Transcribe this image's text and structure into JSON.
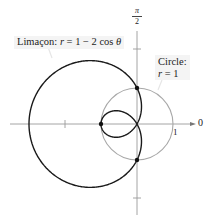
{
  "diagram": {
    "type": "polar-graph",
    "origin_px": [
      137,
      124
    ],
    "unit_px": 36,
    "axes": {
      "polar_axis_label": "0",
      "vertical_axis_label_num": "π",
      "vertical_axis_label_den": "2",
      "tick_label_1": "1"
    },
    "curves": [
      {
        "name": "limacon",
        "label_prefix": "Limaçon: ",
        "label_var": "r",
        "label_eq": " = 1 − 2 cos ",
        "label_theta": "θ",
        "color": "#1a1a1a"
      },
      {
        "name": "circle",
        "label_line1": "Circle:",
        "label_var": "r",
        "label_eq": " = 1",
        "color": "#9a9a9a"
      }
    ],
    "intersection_points": [
      {
        "polar": "r=1, θ=π/2",
        "px": [
          137,
          88
        ]
      },
      {
        "polar": "r=1, θ=3π/2",
        "px": [
          137,
          160
        ]
      },
      {
        "polar": "inner loop vertex",
        "px": [
          101,
          124
        ]
      }
    ],
    "colors": {
      "axis": "#999999",
      "limacon": "#1a1a1a",
      "circle": "#a0a0a0",
      "label_bg": "#f4f4f4"
    }
  }
}
